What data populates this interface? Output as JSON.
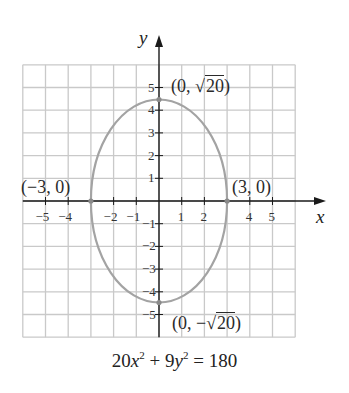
{
  "chart_data": {
    "type": "line",
    "title": "",
    "equation": "20x^2 + 9y^2 = 180",
    "xlabel": "x",
    "ylabel": "y",
    "xlim": [
      -6,
      6
    ],
    "ylim": [
      -6,
      6
    ],
    "grid": true,
    "x_ticks": [
      -5,
      -4,
      -2,
      -1,
      1,
      2,
      4,
      5
    ],
    "y_ticks": [
      5,
      4,
      3,
      2,
      1,
      -1,
      -2,
      -3,
      -4,
      -5
    ],
    "x_tick_labels": [
      "−5",
      "−4",
      "−2",
      "−1",
      "1",
      "2",
      "4",
      "5"
    ],
    "y_tick_labels": [
      "5",
      "4",
      "3",
      "2",
      "1",
      "−1",
      "−2",
      "−3",
      "−4",
      "−5"
    ],
    "series": [
      {
        "name": "ellipse",
        "shape": "ellipse",
        "center": [
          0,
          0
        ],
        "semi_axis_x": 3,
        "semi_axis_y": 4.472,
        "color": "#a3a3a3"
      }
    ],
    "points": [
      {
        "x": 0,
        "y": 4.472,
        "label": "(0, √20)"
      },
      {
        "x": 0,
        "y": -4.472,
        "label": "(0, −√20)"
      },
      {
        "x": -3,
        "y": 0,
        "label": "(−3, 0)"
      },
      {
        "x": 3,
        "y": 0,
        "label": "(3, 0)"
      }
    ],
    "annotations": [
      "(0, √20)",
      "(0, −√20)",
      "(−3, 0)",
      "(3, 0)"
    ]
  },
  "labels": {
    "top_prefix": "(0, ",
    "top_rad": "20",
    "top_suffix": ")",
    "bottom_prefix": "(0, −",
    "bottom_rad": "20",
    "bottom_suffix": ")",
    "left": "(−3, 0)",
    "right": "(3, 0)",
    "radical": "√"
  },
  "equation_parts": {
    "c1": "20",
    "v1": "x",
    "e1": "2",
    "op": " + 9",
    "v2": "y",
    "e2": "2",
    "rest": " = 180"
  },
  "colors": {
    "grid": "#c9c9c9",
    "axes": "#1a1a1a",
    "curve": "#a3a3a3",
    "point": "#8a8a8a"
  }
}
